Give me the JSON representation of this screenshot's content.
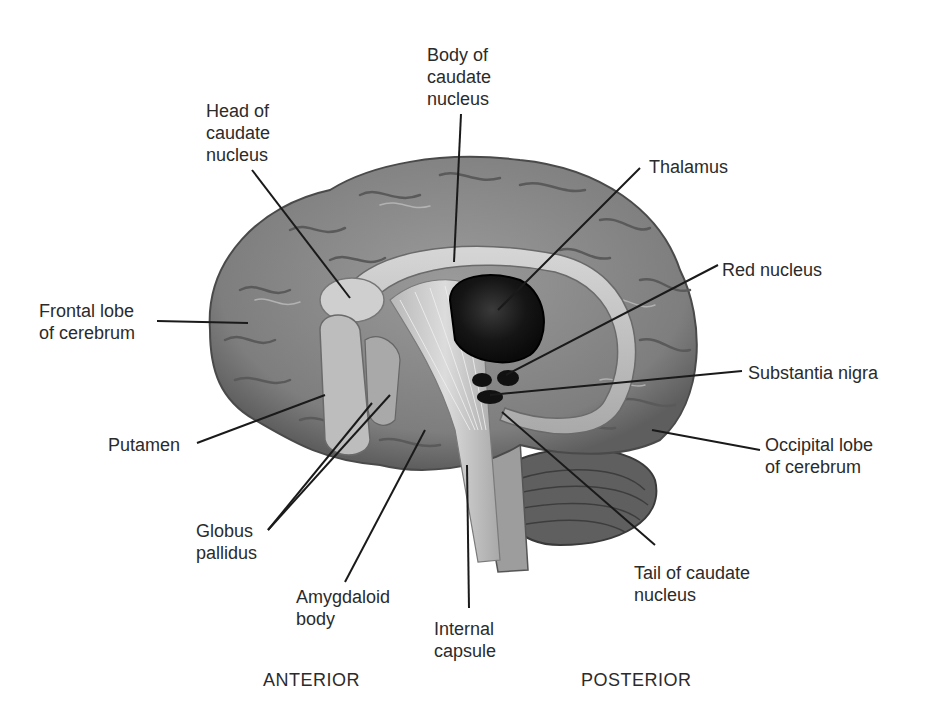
{
  "diagram": {
    "type": "anatomical-illustration",
    "labels": {
      "body_of_caudate": "Body of\ncaudate\nnucleus",
      "head_of_caudate": "Head of\ncaudate\nnucleus",
      "thalamus": "Thalamus",
      "red_nucleus": "Red nucleus",
      "frontal_lobe": "Frontal lobe\nof cerebrum",
      "substantia_nigra": "Substantia nigra",
      "putamen": "Putamen",
      "occipital_lobe": "Occipital lobe\nof cerebrum",
      "globus_pallidus": "Globus\npallidus",
      "amygdaloid_body": "Amygdaloid\nbody",
      "internal_capsule": "Internal\ncapsule",
      "tail_of_caudate": "Tail of caudate\nnucleus"
    },
    "orientation": {
      "anterior": "ANTERIOR",
      "posterior": "POSTERIOR"
    },
    "colors": {
      "background": "#ffffff",
      "cortex": "#8c8c8c",
      "cortex_dark": "#5a5a5a",
      "caudate": "#c8c8c8",
      "thalamus": "#1e1e1e",
      "leader_line": "#1a1a1a",
      "text": "#2b2b2b"
    }
  }
}
